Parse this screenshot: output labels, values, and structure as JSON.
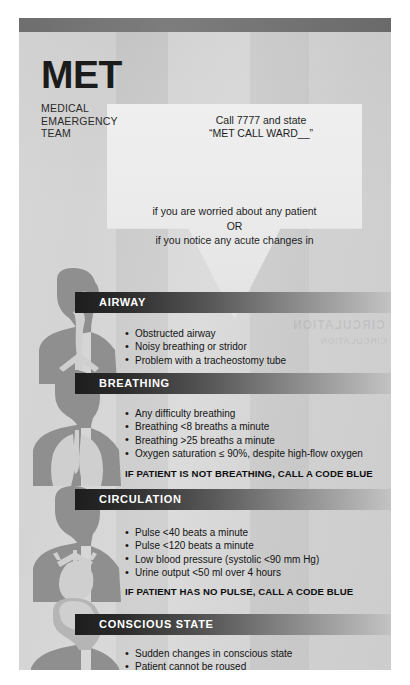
{
  "poster": {
    "title": "MET",
    "subtitle_lines": [
      "MEDICAL",
      "EMAERGENCY",
      "TEAM"
    ],
    "call_instruction": {
      "line1": "Call 7777 and state",
      "line2": "“MET CALL WARD__”"
    },
    "trigger": {
      "line1": "if you are worried about any patient",
      "line2": "OR",
      "line3": "if you notice any acute changes in"
    },
    "bleed_through_artifact": "CIRCULATION",
    "colors": {
      "page_background": "#d2d2d2",
      "top_bar": "#6e6e6e",
      "band_dark": "#1d1d1d",
      "band_light": "#c3c3c3",
      "arrow_fill": "#eaeaea",
      "text": "#141414",
      "figure_body": "#8f8f8f",
      "figure_organ": "#cfcfcf"
    },
    "sections": [
      {
        "id": "airway",
        "label": "AIRWAY",
        "figure_icon": "airway-silhouette-icon",
        "bullets": [
          "Obstructed airway",
          "Noisy breathing or stridor",
          "Problem with a tracheostomy tube"
        ],
        "code_blue": ""
      },
      {
        "id": "breathing",
        "label": "BREATHING",
        "figure_icon": "lungs-silhouette-icon",
        "bullets": [
          "Any difficulty breathing",
          "Breathing <8 breaths a minute",
          "Breathing >25 breaths a minute",
          "Oxygen saturation ≤ 90%, despite high-flow oxygen"
        ],
        "code_blue": "IF PATIENT IS NOT BREATHING, CALL A CODE BLUE"
      },
      {
        "id": "circulation",
        "label": "CIRCULATION",
        "figure_icon": "heart-silhouette-icon",
        "bullets": [
          "Pulse <40 beats a minute",
          "Pulse <120 beats a minute",
          "Low blood pressure (systolic <90 mm Hg)",
          "Urine output <50 ml over 4 hours"
        ],
        "code_blue": "IF PATIENT HAS NO PULSE, CALL A CODE BLUE"
      },
      {
        "id": "conscious-state",
        "label": "CONSCIOUS STATE",
        "figure_icon": "brain-silhouette-icon",
        "bullets": [
          "Sudden changes in conscious state",
          "Patient cannot be roused"
        ],
        "code_blue": ""
      }
    ]
  }
}
